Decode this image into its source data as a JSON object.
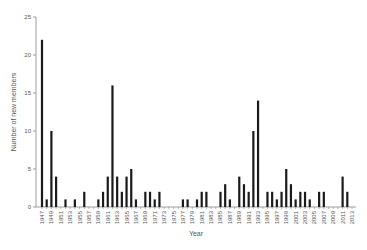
{
  "chart_data": {
    "type": "bar",
    "title": "",
    "xlabel": "Year",
    "ylabel": "Number of new members",
    "ylim": [
      0,
      25
    ],
    "yticks": [
      0,
      5,
      10,
      15,
      20,
      25
    ],
    "xtick_labels": [
      "1947",
      "1949",
      "1951",
      "1953",
      "1955",
      "1957",
      "1959",
      "1961",
      "1963",
      "1965",
      "1967",
      "1969",
      "1971",
      "1973",
      "1975",
      "1977",
      "1979",
      "1981",
      "1983",
      "1985",
      "1987",
      "1989",
      "1991",
      "1993",
      "1995",
      "1997",
      "1999",
      "2001",
      "2003",
      "2005",
      "2007",
      "2009",
      "2011",
      "2013"
    ],
    "x_range": [
      1947,
      2013
    ],
    "grid": false,
    "legend": null,
    "bar_color": "#1a1a1a",
    "axis_color": "#888888",
    "bars": [
      {
        "year": 1947,
        "value": 22
      },
      {
        "year": 1948,
        "value": 1
      },
      {
        "year": 1949,
        "value": 10
      },
      {
        "year": 1950,
        "value": 4
      },
      {
        "year": 1952,
        "value": 1
      },
      {
        "year": 1954,
        "value": 1
      },
      {
        "year": 1956,
        "value": 2
      },
      {
        "year": 1959,
        "value": 1
      },
      {
        "year": 1960,
        "value": 2
      },
      {
        "year": 1961,
        "value": 4
      },
      {
        "year": 1962,
        "value": 16
      },
      {
        "year": 1963,
        "value": 4
      },
      {
        "year": 1964,
        "value": 2
      },
      {
        "year": 1965,
        "value": 4
      },
      {
        "year": 1966,
        "value": 5
      },
      {
        "year": 1967,
        "value": 1
      },
      {
        "year": 1969,
        "value": 2
      },
      {
        "year": 1970,
        "value": 2
      },
      {
        "year": 1971,
        "value": 1
      },
      {
        "year": 1972,
        "value": 2
      },
      {
        "year": 1977,
        "value": 1
      },
      {
        "year": 1978,
        "value": 1
      },
      {
        "year": 1980,
        "value": 1
      },
      {
        "year": 1981,
        "value": 2
      },
      {
        "year": 1982,
        "value": 2
      },
      {
        "year": 1985,
        "value": 2
      },
      {
        "year": 1986,
        "value": 3
      },
      {
        "year": 1987,
        "value": 1
      },
      {
        "year": 1989,
        "value": 4
      },
      {
        "year": 1990,
        "value": 3
      },
      {
        "year": 1991,
        "value": 2
      },
      {
        "year": 1992,
        "value": 10
      },
      {
        "year": 1993,
        "value": 14
      },
      {
        "year": 1995,
        "value": 2
      },
      {
        "year": 1996,
        "value": 2
      },
      {
        "year": 1997,
        "value": 1
      },
      {
        "year": 1998,
        "value": 2
      },
      {
        "year": 1999,
        "value": 5
      },
      {
        "year": 2000,
        "value": 3
      },
      {
        "year": 2001,
        "value": 1
      },
      {
        "year": 2002,
        "value": 2
      },
      {
        "year": 2003,
        "value": 2
      },
      {
        "year": 2004,
        "value": 1
      },
      {
        "year": 2006,
        "value": 2
      },
      {
        "year": 2007,
        "value": 2
      },
      {
        "year": 2011,
        "value": 4
      },
      {
        "year": 2012,
        "value": 2
      }
    ]
  }
}
